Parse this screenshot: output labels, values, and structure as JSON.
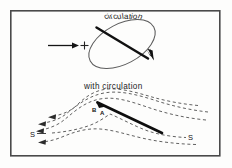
{
  "figure": {
    "background_color": "#fdfdfc",
    "ink_color": "#1c1c1c",
    "frame": {
      "name": "figure-border",
      "x": 10,
      "y": 10,
      "width": 210,
      "height": 146,
      "stroke": "#4a4a4a",
      "stroke_width": 1.6
    }
  },
  "upper_panel": {
    "title_text": "circulation",
    "title_curved": true,
    "freestream_arrow": {
      "name": "freestream-arrow",
      "label": "",
      "x1": 48,
      "y1": 45,
      "x2": 76,
      "y2": 45
    },
    "plus_marker": {
      "name": "plus-marker",
      "symbol": "+",
      "x": 82,
      "y": 45
    },
    "ellipse": {
      "name": "circulation-ellipse",
      "cx": 122,
      "cy": 44,
      "rx": 36,
      "ry": 20,
      "rotation_deg": -28,
      "stroke": "#5a5a5a",
      "stroke_width": 1.0
    },
    "chord_line": {
      "name": "chord-line",
      "x1": 96,
      "y1": 28,
      "x2": 150,
      "y2": 60,
      "stroke": "#111111",
      "stroke_width": 2.4
    },
    "circulation_arrowhead": {
      "name": "circulation-arrowhead",
      "x": 151,
      "y": 48,
      "direction_deg": 62
    }
  },
  "lower_panel": {
    "caption": "with circulation",
    "airfoil": {
      "name": "airfoil-plate",
      "x1": 97,
      "y1": 103,
      "x2": 163,
      "y2": 134,
      "stroke": "#111111",
      "stroke_width": 2.6
    },
    "point_labels": [
      {
        "name": "point-label-b",
        "text": "B",
        "x": 92,
        "y": 107
      },
      {
        "name": "point-label-a",
        "text": "A",
        "x": 100,
        "y": 110
      }
    ],
    "stagnation_labels": [
      {
        "name": "stagnation-label-left",
        "text": "S",
        "x": 30,
        "y": 130
      },
      {
        "name": "stagnation-label-right",
        "text": "S",
        "x": 188,
        "y": 133
      }
    ],
    "streamlines": {
      "name": "streamline-set",
      "style": "dashed",
      "dash_pattern": "3,2.5",
      "stroke": "#4f4f4f",
      "stroke_width": 0.9,
      "count_left": 3,
      "count_right": 3,
      "flow_direction": "right-to-left"
    }
  }
}
